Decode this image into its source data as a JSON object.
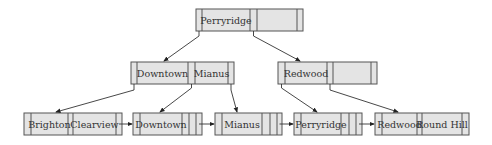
{
  "diagram": {
    "type": "B+ tree",
    "root": {
      "id": "root",
      "keys": [
        "Perryridge"
      ]
    },
    "internal": [
      {
        "id": "int-left",
        "keys": [
          "Downtown",
          "Mianus"
        ]
      },
      {
        "id": "int-right",
        "keys": [
          "Redwood"
        ]
      }
    ],
    "leaves": [
      {
        "id": "leaf-1",
        "keys": [
          "Brighton",
          "Clearview"
        ]
      },
      {
        "id": "leaf-2",
        "keys": [
          "Downtown"
        ]
      },
      {
        "id": "leaf-3",
        "keys": [
          "Mianus"
        ]
      },
      {
        "id": "leaf-4",
        "keys": [
          "Perryridge"
        ]
      },
      {
        "id": "leaf-5",
        "keys": [
          "Redwood",
          "Round Hill"
        ]
      }
    ],
    "edges": [
      {
        "from": "root",
        "to": "int-left"
      },
      {
        "from": "root",
        "to": "int-right"
      },
      {
        "from": "int-left",
        "to": "leaf-1"
      },
      {
        "from": "int-left",
        "to": "leaf-2"
      },
      {
        "from": "int-left",
        "to": "leaf-3"
      },
      {
        "from": "int-right",
        "to": "leaf-4"
      },
      {
        "from": "int-right",
        "to": "leaf-5"
      }
    ],
    "leaf_links": [
      {
        "from": "leaf-1",
        "to": "leaf-2"
      },
      {
        "from": "leaf-2",
        "to": "leaf-3"
      },
      {
        "from": "leaf-3",
        "to": "leaf-4"
      },
      {
        "from": "leaf-4",
        "to": "leaf-5"
      }
    ]
  }
}
